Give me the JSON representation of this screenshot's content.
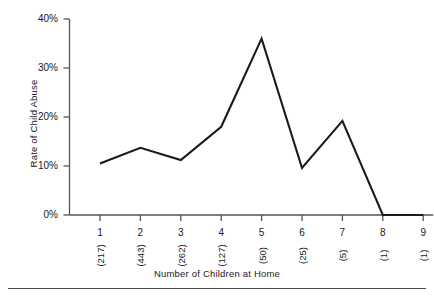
{
  "chart_data": {
    "type": "line",
    "title": "",
    "xlabel": "Number of Children at Home",
    "ylabel": "Rate of Child Abuse",
    "categories": [
      "1",
      "2",
      "3",
      "4",
      "5",
      "6",
      "7",
      "8",
      "9"
    ],
    "group_sizes": [
      "(217)",
      "(443)",
      "(262)",
      "(127)",
      "(50)",
      "(25)",
      "(5)",
      "(1)",
      "(1)"
    ],
    "values": [
      10.5,
      13.7,
      11.2,
      18.0,
      36.0,
      9.6,
      19.2,
      0.0,
      0.0
    ],
    "ylim": [
      0,
      40
    ],
    "yticks": [
      0,
      10,
      20,
      30,
      40
    ],
    "ytick_labels": [
      "0%",
      "10%",
      "20%",
      "30%",
      "40%"
    ],
    "grid": false,
    "legend": "none",
    "line_color": "#1a1a1a",
    "axis_color": "#555555"
  },
  "figure": {
    "y_axis_title": "Rate of Child Abuse",
    "x_axis_title": "Number of Children at Home"
  }
}
